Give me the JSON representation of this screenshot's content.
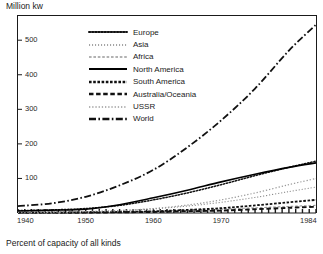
{
  "axis_title": "Million kw",
  "caption": "Percent of capacity of all kinds",
  "chart_data": {
    "type": "line",
    "title": "Million kw",
    "subtitle": "Percent of capacity of all kinds",
    "xlabel": "",
    "ylabel": "Million kw",
    "xlim": [
      1940,
      1984
    ],
    "ylim": [
      0,
      570
    ],
    "grid": false,
    "legend_position": "top-center",
    "xticks": [
      "1940",
      "1950",
      "1960",
      "1970",
      "1984"
    ],
    "xtick_values": [
      1940,
      1950,
      1960,
      1970,
      1984
    ],
    "yticks": [
      "100",
      "200",
      "300",
      "400",
      "500"
    ],
    "ytick_values": [
      100,
      200,
      300,
      400,
      500
    ],
    "x": [
      1940,
      1945,
      1950,
      1955,
      1960,
      1965,
      1970,
      1975,
      1980,
      1984
    ],
    "series": [
      {
        "name": "Europe",
        "style": "dotted",
        "color": "#111111",
        "values": [
          7,
          9,
          13,
          22,
          38,
          58,
          82,
          108,
          132,
          150
        ]
      },
      {
        "name": "Asia",
        "style": "fine-dotted",
        "color": "#888888",
        "values": [
          2,
          3,
          4,
          7,
          12,
          20,
          31,
          45,
          62,
          75
        ]
      },
      {
        "name": "Africa",
        "style": "fine-dashed",
        "color": "#999999",
        "values": [
          1,
          1,
          2,
          3,
          5,
          8,
          11,
          15,
          19,
          22
        ]
      },
      {
        "name": "North America",
        "style": "solid",
        "color": "#000000",
        "values": [
          6,
          8,
          11,
          24,
          44,
          66,
          90,
          112,
          132,
          145
        ]
      },
      {
        "name": "South America",
        "style": "dashed-dot",
        "color": "#111111",
        "values": [
          1,
          1,
          2,
          3,
          5,
          9,
          14,
          22,
          31,
          38
        ]
      },
      {
        "name": "Australia/Oceania",
        "style": "dash",
        "color": "#111111",
        "values": [
          1,
          1,
          1,
          2,
          3,
          5,
          7,
          11,
          15,
          18
        ]
      },
      {
        "name": "USSR",
        "style": "dotted-light",
        "color": "#9a9a9a",
        "values": [
          2,
          2,
          4,
          7,
          13,
          23,
          38,
          58,
          82,
          100
        ]
      },
      {
        "name": "World",
        "style": "dash-dot",
        "color": "#111111",
        "values": [
          20,
          28,
          47,
          80,
          125,
          190,
          268,
          360,
          470,
          545
        ]
      }
    ]
  },
  "legend": {
    "items": [
      {
        "label": "Europe"
      },
      {
        "label": "Asia"
      },
      {
        "label": "Africa"
      },
      {
        "label": "North America"
      },
      {
        "label": "South America"
      },
      {
        "label": "Australia/Oceania"
      },
      {
        "label": "USSR"
      },
      {
        "label": "World"
      }
    ]
  }
}
